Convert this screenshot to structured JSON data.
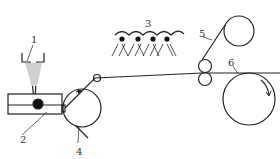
{
  "diagram": {
    "type": "process schematic (film casting / coating line)",
    "labels": [
      {
        "id": "1",
        "text": "1",
        "part": "hopper"
      },
      {
        "id": "2",
        "text": "2",
        "part": "extruder / die block"
      },
      {
        "id": "3",
        "text": "3",
        "part": "spray nozzles"
      },
      {
        "id": "4",
        "text": "4",
        "part": "casting drum with scraper"
      },
      {
        "id": "5",
        "text": "5",
        "part": "upper take-up roll"
      },
      {
        "id": "6",
        "text": "6",
        "part": "winding roll"
      }
    ],
    "colors": {
      "line": "#222222",
      "fill_hopper": "#cfcfcf",
      "background": "#ffffff"
    }
  }
}
